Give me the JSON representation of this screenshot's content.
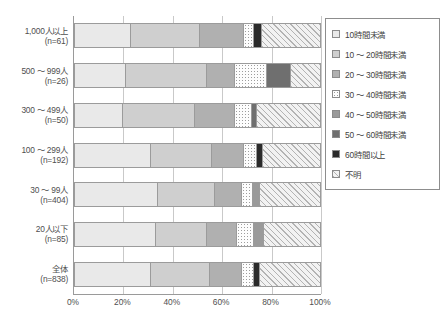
{
  "chart_data": {
    "type": "bar",
    "orientation": "horizontal",
    "stacked": true,
    "stack_mode": "percent",
    "title": "",
    "xlabel": "",
    "ylabel": "",
    "xlim": [
      0,
      100
    ],
    "xticks": [
      "0%",
      "20%",
      "40%",
      "60%",
      "80%",
      "100%"
    ],
    "xtick_values": [
      0,
      20,
      40,
      60,
      80,
      100
    ],
    "grid": true,
    "legend_position": "right",
    "categories": [
      "1,000人以上\n(n=61)",
      "500 ～ 999人\n(n=26)",
      "300 ～ 499人\n(n=50)",
      "100 ～ 299人\n(n=192)",
      "30 ～ 99人\n(n=404)",
      "20人以下\n(n=85)",
      "全体\n(n=838)"
    ],
    "category_rows": [
      {
        "line1": "1,000人以上",
        "line2": "(n=61)"
      },
      {
        "line1": "500 ～ 999人",
        "line2": "(n=26)"
      },
      {
        "line1": "300 ～ 499人",
        "line2": "(n=50)"
      },
      {
        "line1": "100 ～ 299人",
        "line2": "(n=192)"
      },
      {
        "line1": "30 ～ 99人",
        "line2": "(n=404)"
      },
      {
        "line1": "20人以下",
        "line2": "(n=85)"
      },
      {
        "line1": "全体",
        "line2": "(n=838)"
      }
    ],
    "series": [
      {
        "name": "10時間未満",
        "fill": "f0",
        "values": [
          23.0,
          21.0,
          20.0,
          31.0,
          34.0,
          33.0,
          31.0
        ]
      },
      {
        "name": "10 ～ 20時間未満",
        "fill": "f1",
        "values": [
          28.0,
          33.0,
          29.0,
          25.0,
          23.0,
          21.0,
          24.0
        ]
      },
      {
        "name": "20 ～ 30時間未満",
        "fill": "f2",
        "values": [
          18.0,
          11.0,
          16.0,
          13.0,
          11.0,
          12.0,
          13.0
        ]
      },
      {
        "name": "30 ～ 40時間未満",
        "fill": "f3",
        "values": [
          4.0,
          13.0,
          7.0,
          5.0,
          4.5,
          7.0,
          5.0
        ]
      },
      {
        "name": "40 ～ 50時間未満",
        "fill": "f4",
        "values": [
          0.0,
          0.0,
          0.0,
          0.0,
          3.0,
          4.0,
          0.0
        ]
      },
      {
        "name": "50 ～ 60時間未満",
        "fill": "f5",
        "values": [
          0.0,
          10.0,
          2.0,
          0.0,
          0.0,
          0.0,
          0.0
        ]
      },
      {
        "name": "60時間以上",
        "fill": "f6",
        "values": [
          3.0,
          0.0,
          0.0,
          2.5,
          0.0,
          0.0,
          2.5
        ]
      },
      {
        "name": "不明",
        "fill": "f7",
        "values": [
          24.0,
          12.0,
          26.0,
          23.5,
          24.5,
          23.0,
          24.5
        ]
      }
    ],
    "legend_entries": [
      {
        "label": "10時間未満",
        "fill": "f0"
      },
      {
        "label": "10 ～ 20時間未満",
        "fill": "f1"
      },
      {
        "label": "20 ～ 30時間未満",
        "fill": "f2"
      },
      {
        "label": "30 ～ 40時間未満",
        "fill": "f3"
      },
      {
        "label": "40 ～ 50時間未満",
        "fill": "f4"
      },
      {
        "label": "50 ～ 60時間未満",
        "fill": "f5"
      },
      {
        "label": "60時間以上",
        "fill": "f6"
      },
      {
        "label": "不明",
        "fill": "f7"
      }
    ],
    "colors": {
      "f0": "#e9e9e9",
      "f1": "#cfcfcf",
      "f2": "#b0b0b0",
      "f3": "#fdfdfd",
      "f4": "#9a9a9a",
      "f5": "#6f6f6f",
      "f6": "#2b2b2b",
      "f7": "#f2f2f2",
      "axis": "#9a9a9a",
      "grid": "#c9c9c9",
      "text": "#4f4f4f"
    }
  }
}
